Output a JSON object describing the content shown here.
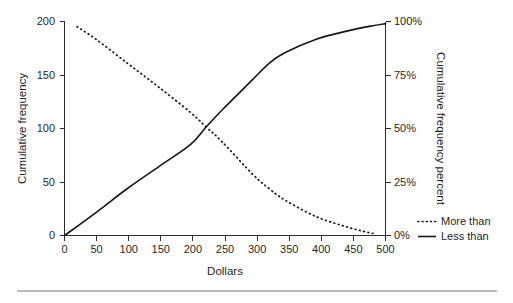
{
  "chart_data": {
    "type": "line",
    "title": "",
    "xlabel": "Dollars",
    "ylabel": "Cumulative frequency",
    "y2label": "Cumulative frequency percent",
    "xlim": [
      0,
      510
    ],
    "ylim": [
      0,
      205
    ],
    "y2lim": [
      0,
      102.5
    ],
    "grid": false,
    "legend_position": "right",
    "xticks": [
      0,
      50,
      100,
      150,
      200,
      250,
      300,
      350,
      400,
      450,
      500
    ],
    "xticklabels": [
      "0",
      "50",
      "100",
      "150",
      "200",
      "250",
      "300",
      "350",
      "400",
      "450",
      "500"
    ],
    "yticks": [
      0,
      50,
      100,
      150,
      200
    ],
    "yticklabels": [
      "0",
      "50",
      "100",
      "150",
      "200"
    ],
    "y2ticks": [
      0,
      25,
      50,
      75,
      100
    ],
    "y2ticklabels": [
      "0%",
      "25%",
      "50%",
      "75%",
      "100%"
    ],
    "series": [
      {
        "name": "More than",
        "style": "dotted",
        "color": "#161616",
        "x": [
          20,
          50,
          100,
          150,
          200,
          225,
          250,
          300,
          325,
          350,
          400,
          450,
          475,
          490
        ],
        "values": [
          200,
          188,
          165,
          142,
          118,
          104,
          90,
          58,
          45,
          34,
          18,
          8,
          4,
          2
        ]
      },
      {
        "name": "Less than",
        "style": "solid",
        "color": "#161616",
        "x": [
          0,
          50,
          100,
          150,
          200,
          225,
          250,
          300,
          325,
          350,
          400,
          450,
          490,
          510
        ],
        "values": [
          0,
          22,
          45,
          66,
          87,
          104,
          120,
          150,
          165,
          175,
          188,
          196,
          201,
          203
        ]
      }
    ],
    "legend": [
      {
        "label": "More than",
        "style": "dotted"
      },
      {
        "label": "Less than",
        "style": "solid"
      }
    ]
  },
  "footer": {
    "rule": "horizontal-divider"
  }
}
